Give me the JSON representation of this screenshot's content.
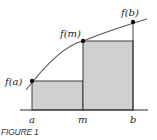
{
  "figure": {
    "caption": "FIGURE 1",
    "points": [
      {
        "label": "f(a)",
        "x_label": "a"
      },
      {
        "label": "f(m)",
        "x_label": "m"
      },
      {
        "label": "f(b)",
        "x_label": "b"
      }
    ],
    "colors": {
      "rect_fill": "#d0d0d0",
      "stroke": "#2a2a2a",
      "curve": "#555555"
    }
  }
}
